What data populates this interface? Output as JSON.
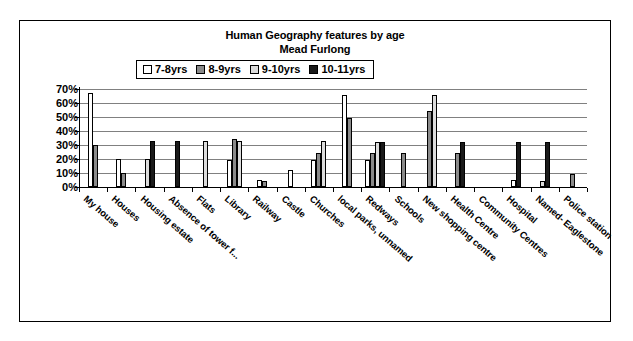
{
  "chart_data": {
    "type": "bar",
    "title": "Human Geography features by age",
    "subtitle": "Mead Furlong",
    "xlabel": "",
    "ylabel": "",
    "ylim": [
      0,
      70
    ],
    "ytick_labels": [
      "70%",
      "60%",
      "50%",
      "40%",
      "30%",
      "20%",
      "10%",
      "0%"
    ],
    "ytick_values": [
      70,
      60,
      50,
      40,
      30,
      20,
      10,
      0
    ],
    "grid": true,
    "legend_position": "top-center",
    "categories": [
      "My house",
      "Houses",
      "Housing estate",
      "Absence of tower f...",
      "Flats",
      "Library",
      "Railway",
      "Castle",
      "Churches",
      "local parks, unnamed",
      "Redways",
      "Schools",
      "New shopping centre",
      "Health Centre",
      "Community Centres",
      "Hospital",
      "Named- Eaglestone",
      "Police station"
    ],
    "series": [
      {
        "name": "7-8yrs",
        "color": "#ffffff",
        "values": [
          67,
          20,
          null,
          null,
          null,
          19,
          5,
          12,
          19,
          66,
          19,
          null,
          null,
          null,
          null,
          5,
          null,
          null
        ]
      },
      {
        "name": "8-9yrs",
        "color": "#8a8a8a",
        "values": [
          30,
          10,
          null,
          null,
          null,
          34,
          4,
          null,
          24,
          49,
          24,
          24,
          54,
          24,
          null,
          null,
          null,
          9
        ]
      },
      {
        "name": "9-10yrs",
        "color": "#dcdcdc",
        "values": [
          null,
          null,
          20,
          null,
          33,
          33,
          null,
          null,
          33,
          null,
          32,
          null,
          66,
          null,
          null,
          null,
          4,
          null
        ]
      },
      {
        "name": "10-11yrs",
        "color": "#1a1a1a",
        "values": [
          null,
          null,
          33,
          33,
          null,
          null,
          null,
          null,
          null,
          null,
          32,
          null,
          null,
          32,
          null,
          32,
          32,
          null
        ]
      }
    ]
  },
  "legend": {
    "entries": [
      {
        "label": "7-8yrs"
      },
      {
        "label": "8-9yrs"
      },
      {
        "label": "9-10yrs"
      },
      {
        "label": "10-11yrs"
      }
    ]
  }
}
